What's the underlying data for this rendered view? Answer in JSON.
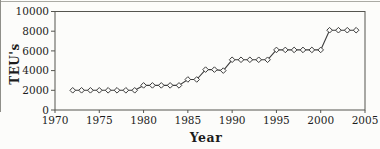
{
  "chart_data": {
    "type": "line",
    "title": "",
    "xlabel": "Year",
    "ylabel": "TEU's",
    "x": [
      1972,
      1973,
      1974,
      1975,
      1976,
      1977,
      1978,
      1979,
      1980,
      1981,
      1982,
      1983,
      1984,
      1985,
      1986,
      1987,
      1988,
      1989,
      1990,
      1991,
      1992,
      1993,
      1994,
      1995,
      1996,
      1997,
      1998,
      1999,
      2000,
      2001,
      2002,
      2003,
      2004
    ],
    "y": [
      2000,
      2000,
      2000,
      2000,
      2000,
      2000,
      2000,
      2000,
      2500,
      2500,
      2500,
      2500,
      2500,
      3100,
      3100,
      4100,
      4100,
      4000,
      5100,
      5100,
      5100,
      5100,
      5100,
      6100,
      6100,
      6100,
      6100,
      6100,
      6100,
      8100,
      8100,
      8100,
      8100
    ],
    "xlim": [
      1970,
      2005
    ],
    "ylim": [
      0,
      10000
    ],
    "x_ticks": [
      1970,
      1975,
      1980,
      1985,
      1990,
      1995,
      2000,
      2005
    ],
    "y_ticks": [
      0,
      2000,
      4000,
      6000,
      8000,
      10000
    ],
    "grid": false,
    "legend": "none",
    "marker": "open-diamond",
    "frame": "box",
    "colors": {
      "line": "#3d3d3d",
      "marker_fill": "#fcfcfa",
      "axis": "#55554f",
      "text": "#1c1c1c",
      "background": "#fcfcfa"
    }
  }
}
